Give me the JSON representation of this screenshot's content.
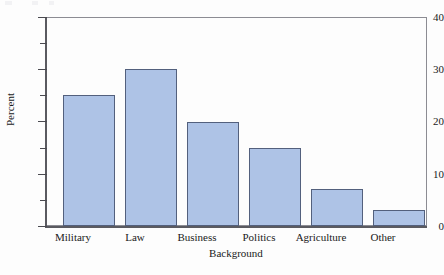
{
  "figure": {
    "background_color": "#fdfdfd",
    "bar_fill_color": "#aec3e6",
    "bar_edge_color": "#53607d",
    "axis_color": "#5a5a60"
  },
  "chart_data": {
    "type": "bar",
    "title": "",
    "xlabel": "Background",
    "ylabel": "Percent",
    "categories": [
      "Military",
      "Law",
      "Business",
      "Politics",
      "Agriculture",
      "Other"
    ],
    "values": [
      25,
      30,
      20,
      15,
      7,
      3
    ],
    "ylim": [
      0,
      40
    ],
    "y_major_ticks": [
      0,
      10,
      20,
      30,
      40
    ],
    "y_minor_ticks": [
      5,
      15,
      25,
      35
    ],
    "y_tick_labels": [
      "0",
      "10",
      "20",
      "30",
      "40"
    ],
    "grid": false,
    "legend": null,
    "legend_position": "none"
  }
}
